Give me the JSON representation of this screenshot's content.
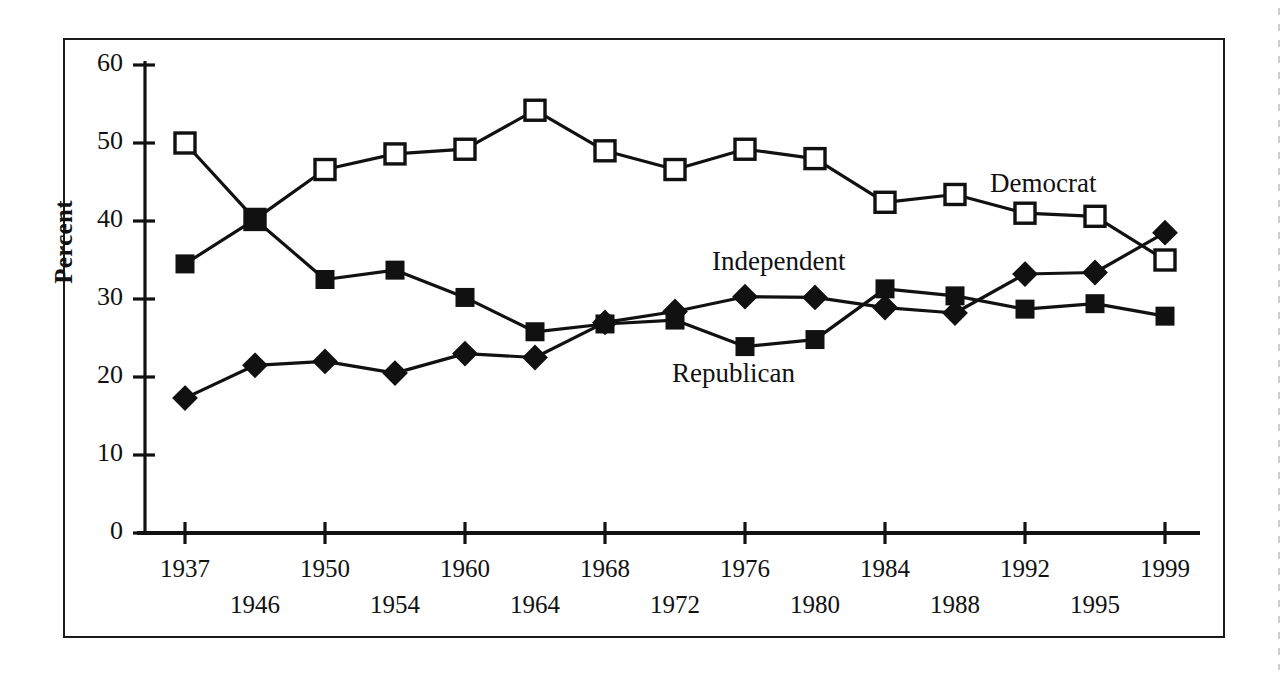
{
  "figure": {
    "ylabel": "Percent",
    "border_color": "#1a1a1a",
    "ink_color": "#111111"
  },
  "axis": {
    "y_ticks": [
      "60",
      "50",
      "40",
      "30",
      "20",
      "10",
      "0"
    ],
    "x_ticks_upper": [
      "1937",
      "1950",
      "1960",
      "1968",
      "1976",
      "1984",
      "1992",
      "1999"
    ],
    "x_ticks_lower": [
      "1946",
      "1954",
      "1964",
      "1972",
      "1980",
      "1988",
      "1995"
    ]
  },
  "series_labels": {
    "democrat": "Democrat",
    "independent": "Independent",
    "republican": "Republican"
  },
  "chart_data": {
    "type": "line",
    "title": "",
    "xlabel": "",
    "ylabel": "Percent",
    "ylim": [
      0,
      60
    ],
    "ytick_step": 10,
    "grid": false,
    "legend_position": "inline-annotations",
    "x": [
      "1937",
      "1946",
      "1950",
      "1954",
      "1960",
      "1964",
      "1968",
      "1972",
      "1976",
      "1980",
      "1984",
      "1988",
      "1992",
      "1995",
      "1999"
    ],
    "series": [
      {
        "name": "Democrat",
        "marker": "open-square",
        "values": [
          50.0,
          40.2,
          46.6,
          48.6,
          49.2,
          54.2,
          49.0,
          46.6,
          49.2,
          48.0,
          42.4,
          43.4,
          41.0,
          40.6,
          35.0
        ]
      },
      {
        "name": "Independent",
        "marker": "filled-square",
        "values": [
          34.5,
          40.2,
          32.5,
          33.7,
          30.2,
          25.8,
          26.8,
          27.3,
          23.9,
          24.8,
          31.3,
          30.4,
          28.7,
          29.4,
          27.8
        ]
      },
      {
        "name": "Republican",
        "marker": "filled-diamond",
        "values": [
          17.3,
          21.5,
          22.0,
          20.5,
          23.0,
          22.5,
          27.0,
          28.4,
          30.3,
          30.2,
          28.9,
          28.2,
          33.2,
          33.4,
          38.5
        ]
      }
    ]
  }
}
